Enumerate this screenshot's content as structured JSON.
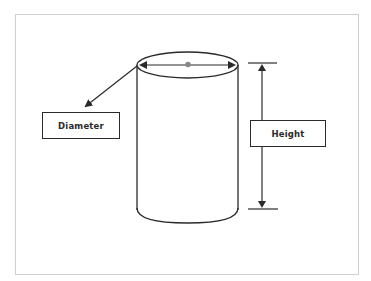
{
  "diagram": {
    "labels": {
      "diameter": "Diameter",
      "height": "Height"
    },
    "colors": {
      "stroke": "#2a2a2a",
      "center_dot": "#888888",
      "frame_border": "#cfcfcf",
      "background": "#ffffff"
    }
  }
}
